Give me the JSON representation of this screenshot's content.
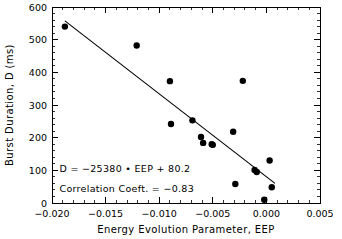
{
  "chart_data": {
    "type": "scatter",
    "title": "",
    "xlabel": "Energy Evolution Parameter, EEP",
    "ylabel": "Burst Duration, D (ms)",
    "xlim": [
      -0.02,
      0.005
    ],
    "ylim": [
      0,
      600
    ],
    "xticks": [
      -0.02,
      -0.015,
      -0.01,
      -0.005,
      0.0,
      0.005
    ],
    "xtick_labels": [
      "-0.020",
      "-0.015",
      "-0.010",
      "-0.005",
      "0.000",
      "0.005"
    ],
    "yticks": [
      0,
      100,
      200,
      300,
      400,
      500,
      600
    ],
    "ytick_labels": [
      "0",
      "100",
      "200",
      "300",
      "400",
      "500",
      "600"
    ],
    "grid": false,
    "legend": "none",
    "minor_ticks": true,
    "x": [
      -0.0188,
      -0.0121,
      -0.009,
      -0.0089,
      -0.0069,
      -0.0061,
      -0.0059,
      -0.0051,
      -0.005,
      -0.0031,
      -0.0029,
      -0.0022,
      -0.0011,
      -0.0009,
      -0.0002,
      0.0003,
      0.0005
    ],
    "y": [
      540,
      482,
      373,
      242,
      253,
      202,
      184,
      180,
      178,
      218,
      58,
      374,
      101,
      95,
      10,
      130,
      48
    ],
    "marker": "filled-circle",
    "marker_color": "#000000",
    "fit_line": {
      "slope": -25380,
      "intercept": 80.2,
      "x_start": -0.0188,
      "x_end": 0.0008,
      "color": "#000000"
    },
    "annotations": [
      {
        "id": "equation",
        "text": "D = -25380 • EEP + 80.2",
        "x": -0.0193,
        "y": 95
      },
      {
        "id": "correlation",
        "text": "Correlation Coeft. = -0.83",
        "x": -0.0193,
        "y": 33
      }
    ],
    "correlation_coefficient": -0.83
  }
}
